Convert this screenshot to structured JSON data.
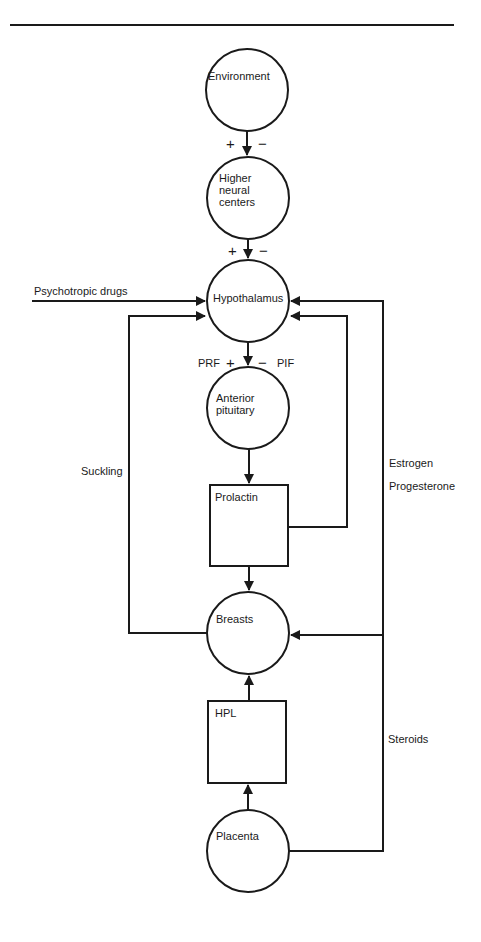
{
  "nodes": {
    "environment": "Environment",
    "higher_neural_1": "Higher",
    "higher_neural_2": "neural",
    "higher_neural_3": "centers",
    "hypothalamus": "Hypothalamus",
    "anterior_1": "Anterior",
    "anterior_2": "pituitary",
    "prolactin": "Prolactin",
    "breasts": "Breasts",
    "hpl": "HPL",
    "placenta": "Placenta"
  },
  "labels": {
    "psychotropic": "Psychotropic drugs",
    "suckling": "Suckling",
    "estrogen": "Estrogen",
    "progesterone": "Progesterone",
    "steroids": "Steroids",
    "prf": "PRF",
    "pif": "PIF",
    "plus": "+",
    "minus": "−"
  },
  "colors": {
    "line": "#1a1a1a",
    "background": "#ffffff"
  }
}
